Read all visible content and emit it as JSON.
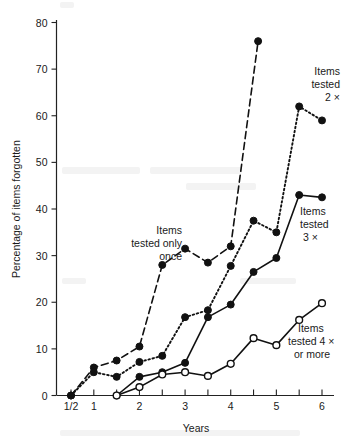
{
  "chart_data": {
    "type": "line",
    "title": "",
    "xlabel": "Years",
    "ylabel": "Percentage of items forgotten",
    "xlim": [
      0,
      6.35
    ],
    "ylim": [
      0,
      80
    ],
    "grid": false,
    "legend_position": "inline-annotations",
    "y_ticks": [
      0,
      10,
      20,
      30,
      40,
      50,
      60,
      70,
      80
    ],
    "y_tick_labels": [
      "0",
      "10",
      "20",
      "30",
      "40",
      "50",
      "60",
      "70",
      "80"
    ],
    "x_ticks": [
      0.5,
      1,
      1.5,
      2,
      2.5,
      3,
      3.5,
      4,
      4.5,
      5,
      5.5,
      6
    ],
    "x_tick_labels": [
      "1/2",
      "1",
      "",
      "2",
      "",
      "3",
      "",
      "4",
      "",
      "5",
      "",
      "6"
    ],
    "x_major_labels": [
      {
        "x": 0.5,
        "label": "1/2"
      },
      {
        "x": 1,
        "label": "1"
      },
      {
        "x": 2,
        "label": "2"
      },
      {
        "x": 3,
        "label": "3"
      },
      {
        "x": 4,
        "label": "4"
      },
      {
        "x": 5,
        "label": "5"
      },
      {
        "x": 6,
        "label": "6"
      }
    ],
    "series": [
      {
        "name": "Items tested only once",
        "style": "dashed",
        "marker": "filled-circle",
        "x": [
          0.5,
          1,
          1.5,
          2,
          2.5,
          3,
          3.5,
          4,
          4.6
        ],
        "values": [
          0,
          6,
          7.5,
          10.5,
          28,
          31.5,
          28.5,
          32,
          76
        ]
      },
      {
        "name": "Items tested 2×",
        "style": "dotted",
        "marker": "filled-circle",
        "x": [
          0.5,
          1,
          1.5,
          2,
          2.5,
          3,
          3.5,
          4,
          4.5,
          5,
          5.5,
          6
        ],
        "values": [
          0,
          5,
          4,
          7.2,
          8.5,
          16.8,
          18.3,
          27.8,
          37.5,
          35,
          62,
          59
        ]
      },
      {
        "name": "Items tested 3×",
        "style": "solid",
        "marker": "filled-circle",
        "x": [
          1.5,
          2,
          2.5,
          3,
          3.5,
          4,
          4.5,
          5,
          5.5,
          6
        ],
        "values": [
          0,
          4,
          5,
          7,
          16.8,
          19.5,
          26.5,
          29.5,
          43,
          42.5
        ]
      },
      {
        "name": "Items tested 4× or more",
        "style": "solid",
        "marker": "open-circle",
        "x": [
          1.5,
          2,
          2.5,
          3,
          3.5,
          4,
          4.5,
          5,
          5.5,
          6
        ],
        "values": [
          0,
          1.8,
          4.5,
          5,
          4.2,
          6.8,
          12.3,
          10.8,
          16.2,
          19.8
        ]
      }
    ],
    "annotations": [
      {
        "id": "once",
        "lines": [
          "Items",
          "tested only",
          "once"
        ],
        "align": "right"
      },
      {
        "id": "twice",
        "lines": [
          "Items",
          "tested",
          "2 ×"
        ],
        "align": "right"
      },
      {
        "id": "thrice",
        "lines": [
          "Items",
          "tested",
          "3 ×"
        ],
        "align": "left"
      },
      {
        "id": "four-plus",
        "lines": [
          "Items",
          "tested 4 ×",
          "or more"
        ],
        "align": "left"
      }
    ]
  },
  "colors": {
    "ink": "#111111",
    "axis": "#222222",
    "background": "#ffffff"
  }
}
